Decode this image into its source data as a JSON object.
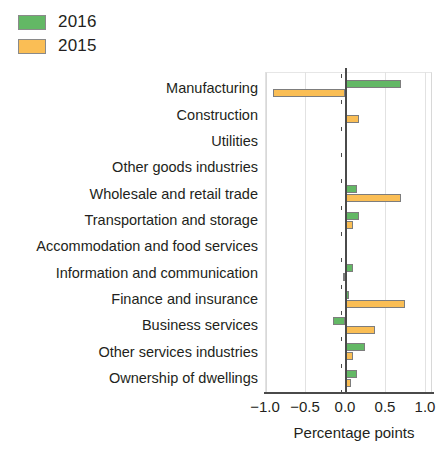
{
  "legend": {
    "items": [
      {
        "label": "2016",
        "color": "#63b865",
        "name": "legend-2016"
      },
      {
        "label": "2015",
        "color": "#fabe55",
        "name": "legend-2015"
      }
    ]
  },
  "axis": {
    "xlabel": "Percentage points",
    "ticks": [
      "-1.0",
      "-0.5",
      "0.0",
      "0.5",
      "1.0"
    ],
    "tick_values": [
      -1.0,
      -0.5,
      0.0,
      0.5,
      1.0
    ]
  },
  "chart_data": {
    "type": "bar",
    "orientation": "horizontal",
    "title": "",
    "subtitle": "",
    "xlabel": "Percentage points",
    "ylabel": "",
    "xlim": [
      -1.0,
      1.0
    ],
    "grid": true,
    "legend_position": "top-left",
    "categories": [
      "Manufacturing",
      "Construction",
      "Utilities",
      "Other goods industries",
      "Wholesale and retail trade",
      "Transportation and storage",
      "Accommodation and food services",
      "Information and communication",
      "Finance and insurance",
      "Business services",
      "Other services industries",
      "Ownership of dwellings"
    ],
    "series": [
      {
        "name": "2016",
        "color": "#63b865",
        "values": [
          0.7,
          0.01,
          0.01,
          0.01,
          0.15,
          0.17,
          0.02,
          0.1,
          0.05,
          -0.15,
          0.25,
          0.15
        ]
      },
      {
        "name": "2015",
        "color": "#fabe55",
        "values": [
          -0.9,
          0.17,
          0.0,
          0.0,
          0.7,
          0.1,
          0.0,
          -0.02,
          0.75,
          0.38,
          0.1,
          0.08
        ]
      }
    ]
  }
}
